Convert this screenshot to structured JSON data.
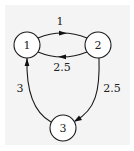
{
  "diagram": {
    "type": "weighted-directed-graph",
    "background_color": "#f4f4f4",
    "nodes": [
      {
        "id": "1",
        "label": "1",
        "cx": 27,
        "cy": 45,
        "r": 13
      },
      {
        "id": "2",
        "label": "2",
        "cx": 98,
        "cy": 45,
        "r": 13
      },
      {
        "id": "3",
        "label": "3",
        "cx": 63,
        "cy": 128,
        "r": 13
      }
    ],
    "edges": [
      {
        "from": "1",
        "to": "2",
        "weight": "1"
      },
      {
        "from": "2",
        "to": "1",
        "weight": "2.5"
      },
      {
        "from": "2",
        "to": "3",
        "weight": "2.5"
      },
      {
        "from": "3",
        "to": "1",
        "weight": "3"
      }
    ]
  }
}
